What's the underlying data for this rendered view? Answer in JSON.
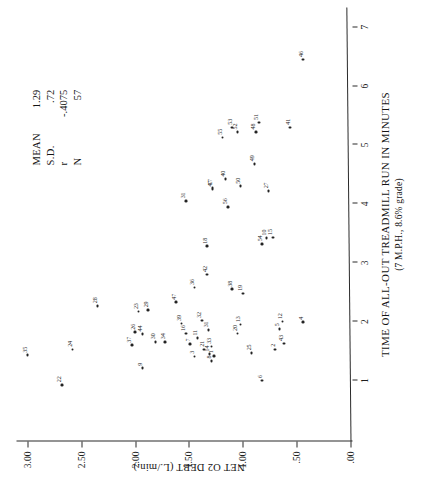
{
  "figure": {
    "orientation_note": "rotated",
    "background_color": "#ffffff",
    "ink_color": "#232323"
  },
  "chart_data": {
    "type": "scatter",
    "title": "",
    "xlabel": "TIME OF ALL-OUT TREADMILL RUN IN MINUTES",
    "xsublabel": "(7 M.P.H., 8.6% grade)",
    "ylabel": "NET O2 DEBT (L./min.)",
    "xlim": [
      0,
      7.3
    ],
    "ylim": [
      0,
      3.12
    ],
    "grid": false,
    "legend_position": "upper-right",
    "xticks": [
      1,
      2,
      3,
      4,
      5,
      6,
      7
    ],
    "xtick_labels": [
      "1",
      "2",
      "3",
      "4",
      "5",
      "6",
      "7"
    ],
    "yticks": [
      0.0,
      0.5,
      1.0,
      1.5,
      2.0,
      2.5,
      3.0
    ],
    "ytick_labels": [
      ".00",
      ".50",
      "1.00",
      "1.50",
      "2.00",
      "2.50",
      "3.00"
    ],
    "point_labels_shown": true,
    "points": [
      {
        "label": "35",
        "x": 1.43,
        "y": 3.0
      },
      {
        "label": "22",
        "x": 0.93,
        "y": 2.68
      },
      {
        "label": "24",
        "x": 1.53,
        "y": 2.58
      },
      {
        "label": "28",
        "x": 2.27,
        "y": 2.35
      },
      {
        "label": "37",
        "x": 1.6,
        "y": 2.03
      },
      {
        "label": "26",
        "x": 1.82,
        "y": 2.0
      },
      {
        "label": "44",
        "x": 1.79,
        "y": 1.93
      },
      {
        "label": "9",
        "x": 1.21,
        "y": 1.93
      },
      {
        "label": "23",
        "x": 2.17,
        "y": 1.97
      },
      {
        "label": "29",
        "x": 2.2,
        "y": 1.88
      },
      {
        "label": "30",
        "x": 1.66,
        "y": 1.81
      },
      {
        "label": "34",
        "x": 1.66,
        "y": 1.72
      },
      {
        "label": "47",
        "x": 2.33,
        "y": 1.62
      },
      {
        "label": "39",
        "x": 1.97,
        "y": 1.57
      },
      {
        "label": "16",
        "x": 1.8,
        "y": 1.53
      },
      {
        "label": "7",
        "x": 1.62,
        "y": 1.49
      },
      {
        "label": "3",
        "x": 1.41,
        "y": 1.45
      },
      {
        "label": "36",
        "x": 2.58,
        "y": 1.45
      },
      {
        "label": "32",
        "x": 2.02,
        "y": 1.38
      },
      {
        "label": "21",
        "x": 1.53,
        "y": 1.36
      },
      {
        "label": "14",
        "x": 1.45,
        "y": 1.31
      },
      {
        "label": "33",
        "x": 1.58,
        "y": 1.29
      },
      {
        "label": "1",
        "x": 1.42,
        "y": 1.27
      },
      {
        "label": "8",
        "x": 1.33,
        "y": 1.29
      },
      {
        "label": "31",
        "x": 1.86,
        "y": 1.32
      },
      {
        "label": "42",
        "x": 2.8,
        "y": 1.33
      },
      {
        "label": "18",
        "x": 3.28,
        "y": 1.33
      },
      {
        "label": "31b",
        "x": 4.05,
        "y": 1.53
      },
      {
        "label": "47b",
        "x": 4.25,
        "y": 1.28
      },
      {
        "label": "56",
        "x": 3.95,
        "y": 1.14
      },
      {
        "label": "40",
        "x": 4.42,
        "y": 1.16
      },
      {
        "label": "55",
        "x": 5.13,
        "y": 1.19
      },
      {
        "label": "53",
        "x": 5.3,
        "y": 1.1
      },
      {
        "label": "52",
        "x": 5.22,
        "y": 1.05
      },
      {
        "label": "38",
        "x": 2.55,
        "y": 1.1
      },
      {
        "label": "20",
        "x": 1.8,
        "y": 1.05
      },
      {
        "label": "13",
        "x": 1.95,
        "y": 1.02
      },
      {
        "label": "19",
        "x": 2.48,
        "y": 1.0
      },
      {
        "label": "25",
        "x": 1.47,
        "y": 0.92
      },
      {
        "label": "6",
        "x": 1.0,
        "y": 0.82
      },
      {
        "label": "50",
        "x": 4.3,
        "y": 1.02
      },
      {
        "label": "49",
        "x": 4.68,
        "y": 0.89
      },
      {
        "label": "48",
        "x": 5.22,
        "y": 0.88
      },
      {
        "label": "51",
        "x": 5.38,
        "y": 0.85
      },
      {
        "label": "54",
        "x": 3.32,
        "y": 0.82
      },
      {
        "label": "10",
        "x": 3.42,
        "y": 0.78
      },
      {
        "label": "15",
        "x": 3.43,
        "y": 0.72
      },
      {
        "label": "27",
        "x": 4.22,
        "y": 0.76
      },
      {
        "label": "2",
        "x": 1.53,
        "y": 0.7
      },
      {
        "label": "5",
        "x": 1.88,
        "y": 0.66
      },
      {
        "label": "12",
        "x": 2.0,
        "y": 0.63
      },
      {
        "label": "43",
        "x": 1.63,
        "y": 0.62
      },
      {
        "label": "41",
        "x": 5.3,
        "y": 0.56
      },
      {
        "label": "4",
        "x": 1.99,
        "y": 0.44
      },
      {
        "label": "46",
        "x": 6.45,
        "y": 0.44
      },
      {
        "label": "11",
        "x": 1.72,
        "y": 1.42
      },
      {
        "label": "17",
        "x": 4.28,
        "y": 1.28
      }
    ]
  },
  "stats": {
    "rows": [
      {
        "key": "MEAN",
        "value": "1.29"
      },
      {
        "key": "S.D.",
        "value": ".72"
      },
      {
        "key": "r",
        "value": "-.4075"
      },
      {
        "key": "N",
        "value": "57"
      }
    ]
  }
}
